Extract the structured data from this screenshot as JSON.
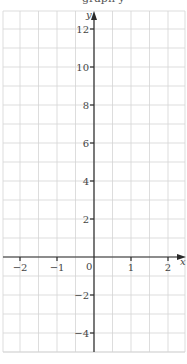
{
  "chart_data": {
    "type": "line",
    "title": "",
    "xlabel": "x",
    "ylabel": "y",
    "xlim": [
      -2.5,
      2.5
    ],
    "ylim": [
      -5,
      13
    ],
    "x_ticks": [
      -2,
      -1,
      0,
      1,
      2
    ],
    "x_tick_labels": [
      "−2",
      "−1",
      "0",
      "1",
      "2"
    ],
    "y_ticks": [
      -4,
      -2,
      2,
      4,
      6,
      8,
      10,
      12
    ],
    "y_tick_labels": [
      "−4",
      "−2",
      "2",
      "4",
      "6",
      "8",
      "10",
      "12"
    ],
    "origin_label": "0",
    "grid": true,
    "grid_x_step": 0.5,
    "grid_y_step": 1,
    "series": [],
    "legend": null
  },
  "colors": {
    "grid": "#d4d4d4",
    "axis": "#2a2a2a",
    "text": "#444444"
  }
}
